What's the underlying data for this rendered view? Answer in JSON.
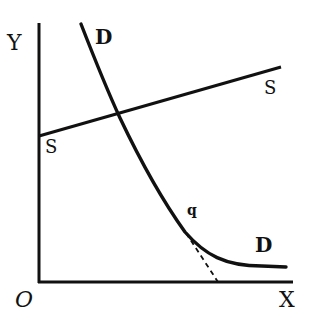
{
  "diagram": {
    "type": "supply-demand",
    "axes": {
      "y_label": "Y",
      "x_label": "X",
      "origin_label": "O"
    },
    "curves": [
      {
        "id": "supply",
        "label_start": "S",
        "label_end": "S"
      },
      {
        "id": "demand",
        "label_start": "D",
        "label_end": "D"
      }
    ],
    "points": [
      {
        "id": "tangent-point",
        "label": "q"
      }
    ],
    "annotations": [
      {
        "id": "tangent-line",
        "style": "dashed"
      }
    ],
    "colors": {
      "ink": "#111111",
      "background": "#ffffff"
    }
  }
}
